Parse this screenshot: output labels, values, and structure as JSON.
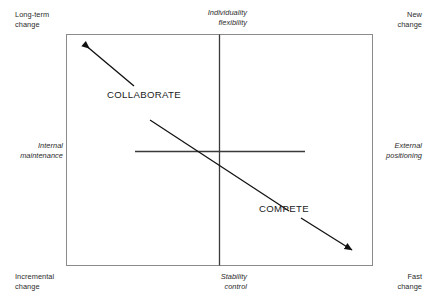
{
  "diagram": {
    "type": "two-axis-quadrant-diagram",
    "colors": {
      "frame": "#8a8a8a",
      "axis": "#3a3a3a",
      "arrow": "#111111",
      "text": "#2b2b2b",
      "background": "#ffffff"
    },
    "corner_labels": {
      "top_left": "Long-term\nchange",
      "top_right": "New\nchange",
      "bottom_left": "Incremental\nchange",
      "bottom_right": "Fast\nchange"
    },
    "axis_labels": {
      "top_center": "Individuality\nflexibility",
      "bottom_center": "Stability\ncontrol",
      "left_center": "Internal\nmaintenance",
      "right_center": "External\npositioning"
    },
    "strategies": [
      {
        "name": "COLLABORATE",
        "quadrant": "upper-left",
        "arrow_direction": "up-left"
      },
      {
        "name": "COMPETE",
        "quadrant": "lower-right",
        "arrow_direction": "down-right"
      }
    ]
  }
}
